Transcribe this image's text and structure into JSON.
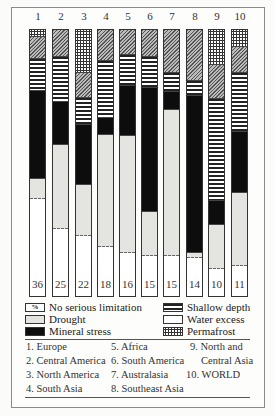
{
  "chart_data": {
    "type": "bar",
    "stacked": true,
    "categories": [
      "1",
      "2",
      "3",
      "4",
      "5",
      "6",
      "7",
      "8",
      "9",
      "10"
    ],
    "segment_order_top_to_bottom": [
      "Permafrost",
      "Water excess",
      "Shallow depth",
      "Mineral stress",
      "Drought",
      "No serious limitation"
    ],
    "series": [
      {
        "name": "Permafrost",
        "pattern": "dotted",
        "values": [
          2.6,
          0,
          16.0,
          0,
          0,
          0,
          0,
          0,
          13.1,
          6.3
        ]
      },
      {
        "name": "Water excess",
        "pattern": "diagonal-hatch",
        "values": [
          8.2,
          10.1,
          9.7,
          11.6,
          9.3,
          10.1,
          16.0,
          19.0,
          12.7,
          9.7
        ]
      },
      {
        "name": "Shallow depth",
        "pattern": "horizontal-stripes",
        "values": [
          12.3,
          16.8,
          10.1,
          21.6,
          11.9,
          11.6,
          7.5,
          6.0,
          38.4,
          22.4
        ]
      },
      {
        "name": "Mineral stress",
        "pattern": "solid-black",
        "values": [
          32.8,
          16.4,
          22.4,
          6.3,
          18.7,
          46.6,
          6.7,
          59.0,
          9.0,
          22.8
        ]
      },
      {
        "name": "Drought",
        "pattern": "light-stipple",
        "values": [
          7.8,
          31.7,
          19.4,
          42.2,
          44.0,
          16.8,
          54.9,
          1.9,
          16.8,
          27.6
        ]
      },
      {
        "name": "No serious limitation",
        "pattern": "white",
        "values": [
          36,
          25,
          22,
          18,
          16,
          15,
          15,
          14,
          10,
          11
        ]
      }
    ],
    "bar_labels_percent": [
      "36",
      "25",
      "22",
      "18",
      "16",
      "15",
      "15",
      "14",
      "10",
      "11"
    ],
    "ylim": [
      0,
      100
    ],
    "grid": false,
    "legend_position": "bottom"
  },
  "bars": [
    {
      "num": "1",
      "pct": "36",
      "segs": [
        [
          "permafrost",
          2.6
        ],
        [
          "hatch",
          8.2
        ],
        [
          "stripes",
          12.3
        ],
        [
          "black",
          32.8
        ],
        [
          "drought",
          7.8
        ],
        [
          "white",
          36.3
        ]
      ]
    },
    {
      "num": "2",
      "pct": "25",
      "segs": [
        [
          "hatch",
          10.1
        ],
        [
          "stripes",
          16.8
        ],
        [
          "black",
          16.4
        ],
        [
          "drought",
          31.7
        ],
        [
          "white",
          25.0
        ]
      ]
    },
    {
      "num": "3",
      "pct": "22",
      "segs": [
        [
          "permafrost",
          16.0
        ],
        [
          "hatch",
          9.7
        ],
        [
          "stripes",
          10.1
        ],
        [
          "black",
          22.4
        ],
        [
          "drought",
          19.4
        ],
        [
          "white",
          22.4
        ]
      ]
    },
    {
      "num": "4",
      "pct": "18",
      "segs": [
        [
          "hatch",
          11.6
        ],
        [
          "stripes",
          21.6
        ],
        [
          "black",
          6.3
        ],
        [
          "drought",
          42.2
        ],
        [
          "white",
          18.3
        ]
      ]
    },
    {
      "num": "5",
      "pct": "16",
      "segs": [
        [
          "hatch",
          9.3
        ],
        [
          "stripes",
          11.9
        ],
        [
          "black",
          18.7
        ],
        [
          "drought",
          44.0
        ],
        [
          "white",
          16.1
        ]
      ]
    },
    {
      "num": "6",
      "pct": "15",
      "segs": [
        [
          "hatch",
          10.1
        ],
        [
          "stripes",
          11.6
        ],
        [
          "black",
          46.6
        ],
        [
          "drought",
          16.8
        ],
        [
          "white",
          14.9
        ]
      ]
    },
    {
      "num": "7",
      "pct": "15",
      "segs": [
        [
          "hatch",
          16.0
        ],
        [
          "stripes",
          7.5
        ],
        [
          "black",
          6.7
        ],
        [
          "drought",
          54.9
        ],
        [
          "white",
          14.9
        ]
      ]
    },
    {
      "num": "8",
      "pct": "14",
      "segs": [
        [
          "hatch",
          19.0
        ],
        [
          "stripes",
          6.0
        ],
        [
          "black",
          59.0
        ],
        [
          "drought",
          1.9
        ],
        [
          "white",
          14.1
        ]
      ]
    },
    {
      "num": "9",
      "pct": "10",
      "segs": [
        [
          "permafrost",
          13.1
        ],
        [
          "hatch",
          12.7
        ],
        [
          "stripes",
          38.4
        ],
        [
          "black",
          9.0
        ],
        [
          "drought",
          16.8
        ],
        [
          "white",
          10.0
        ]
      ]
    },
    {
      "num": "10",
      "pct": "11",
      "segs": [
        [
          "permafrost",
          6.3
        ],
        [
          "hatch",
          9.7
        ],
        [
          "stripes",
          22.4
        ],
        [
          "black",
          22.8
        ],
        [
          "drought",
          27.6
        ],
        [
          "white",
          11.2
        ]
      ]
    }
  ],
  "legend": {
    "no_serious_limitation": {
      "symbol": "%",
      "label": "No serious limitation"
    },
    "drought": {
      "label": "Drought"
    },
    "mineral_stress": {
      "label": "Mineral stress"
    },
    "shallow_depth": {
      "label": "Shallow depth"
    },
    "water_excess": {
      "label": "Water excess"
    },
    "permafrost": {
      "label": "Permafrost"
    }
  },
  "regions": [
    "1. Europe",
    "2. Central America",
    "3. North America",
    "4. South Asia",
    "5. Africa",
    "6. South America",
    "7. Australasia",
    "8. Southeast Asia",
    "9. North and",
    "Central Asia",
    "10. WORLD"
  ]
}
